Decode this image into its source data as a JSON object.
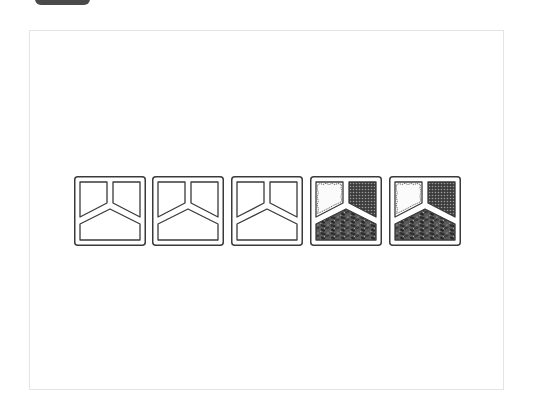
{
  "badge": {
    "label": ""
  },
  "colors": {
    "outline": "#3a3a3a",
    "background": "#ffffff",
    "frame_border": "#e4e4e4",
    "food_dark": "#4a4a4a",
    "badge_bg": "#4a4a4a"
  },
  "trays": [
    {
      "index": 1,
      "state": "empty",
      "compartments": [
        "empty",
        "empty",
        "empty"
      ]
    },
    {
      "index": 2,
      "state": "empty",
      "compartments": [
        "empty",
        "empty",
        "empty"
      ]
    },
    {
      "index": 3,
      "state": "empty",
      "compartments": [
        "empty",
        "empty",
        "empty"
      ]
    },
    {
      "index": 4,
      "state": "filled",
      "compartments": [
        "light-food",
        "dotted-food",
        "chunky-food"
      ]
    },
    {
      "index": 5,
      "state": "filled",
      "compartments": [
        "light-food",
        "dotted-food",
        "chunky-food"
      ]
    }
  ]
}
